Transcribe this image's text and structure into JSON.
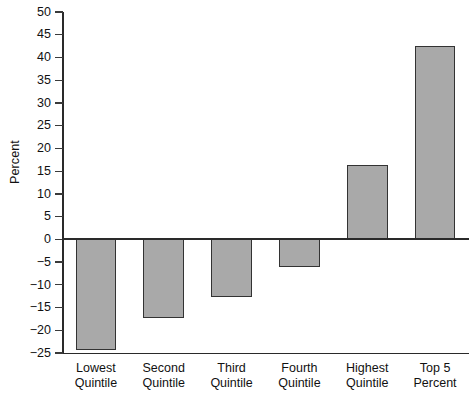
{
  "chart_data": {
    "type": "bar",
    "title": "",
    "subtitle": "",
    "xlabel": "",
    "ylabel": "Percent",
    "categories": [
      "Lowest Quintile",
      "Second Quintile",
      "Third Quintile",
      "Fourth Quintile",
      "Highest Quintile",
      "Top 5 Percent"
    ],
    "category_lines": [
      [
        "Lowest",
        "Quintile"
      ],
      [
        "Second",
        "Quintile"
      ],
      [
        "Third",
        "Quintile"
      ],
      [
        "Fourth",
        "Quintile"
      ],
      [
        "Highest",
        "Quintile"
      ],
      [
        "Top 5",
        "Percent"
      ]
    ],
    "values": [
      -24.3,
      -17.3,
      -12.7,
      -6.1,
      16.3,
      42.6
    ],
    "ylim": [
      -25,
      50
    ],
    "ytick_step": 5,
    "ytick_labels": [
      "50",
      "45",
      "40",
      "35",
      "30",
      "25",
      "20",
      "15",
      "10",
      "5",
      "0",
      "-5",
      "-10",
      "-15",
      "-20",
      "-25"
    ],
    "ytick_values": [
      50,
      45,
      40,
      35,
      30,
      25,
      20,
      15,
      10,
      5,
      0,
      -5,
      -10,
      -15,
      -20,
      -25
    ],
    "grid": false,
    "legend": null,
    "bar_fill_color": "#a9a9a9",
    "bar_border_color": "#333333",
    "axis_color": "#2a2a2a",
    "background_color": "#ffffff"
  }
}
